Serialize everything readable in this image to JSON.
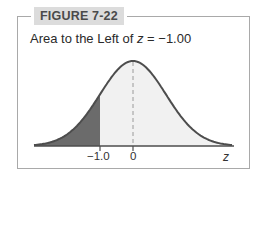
{
  "figure": {
    "label": "FIGURE 7-22",
    "title_prefix": "Area to the Left of ",
    "title_var": "z",
    "title_suffix": " = −1.00"
  },
  "colors": {
    "frame": "#a9a9a9",
    "label_bg": "#dcdcdc",
    "curve": "#4d4d4d",
    "shaded_area": "#6b6b6b",
    "unshaded_area": "#f1f1f1"
  },
  "chart_data": {
    "type": "area",
    "title": "Area to the Left of z = −1.00",
    "distribution": "standard normal",
    "mean": 0,
    "sd": 1,
    "x_range": [
      -3,
      3
    ],
    "shaded_region": {
      "from": -3,
      "to": -1.0,
      "description": "area to the left of z = -1.00"
    },
    "reference_lines": [
      {
        "x": 0,
        "style": "dashed"
      }
    ],
    "xlabel": "z",
    "ylabel": "",
    "tick_labels": [
      "−1.0",
      "0"
    ],
    "tick_values": [
      -1.0,
      0
    ],
    "grid": false,
    "legend": null
  },
  "axis": {
    "ticks": [
      {
        "label": "−1.0"
      },
      {
        "label": "0"
      }
    ],
    "var_label": "z"
  }
}
